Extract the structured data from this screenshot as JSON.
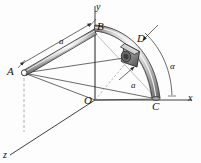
{
  "figure": {
    "background_color": "#fdfdfd",
    "line_color": "#2b2b2b",
    "rod_fill_light": "#f2f2f2",
    "rod_fill_mid": "#b9b9b9",
    "rod_fill_dark": "#6e6e6e",
    "collar_fill": "#9a9a9a",
    "dashed_color": "#9a9a9a"
  },
  "axes": {
    "x_label": "x",
    "y_label": "y",
    "z_label": "z"
  },
  "points": {
    "A": "A",
    "B": "B",
    "C": "C",
    "D": "D",
    "O": "O"
  },
  "dimensions": {
    "length_ab": "a",
    "radius_oc": "a",
    "angle_alpha": "α"
  }
}
